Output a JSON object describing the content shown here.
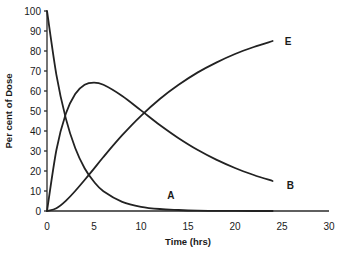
{
  "chart_data": {
    "type": "line",
    "title": "",
    "xlabel": "Time (hrs)",
    "ylabel": "Per cent of Dose",
    "xlim": [
      0,
      30
    ],
    "ylim": [
      0,
      100
    ],
    "x_ticks": [
      0,
      5,
      10,
      15,
      20,
      25,
      30
    ],
    "y_ticks": [
      0,
      10,
      20,
      30,
      40,
      50,
      60,
      70,
      80,
      90,
      100
    ],
    "grid": false,
    "legend": "inline labels at curve ends",
    "x": [
      0,
      1,
      2,
      3,
      4,
      5,
      6,
      8,
      10,
      12,
      14,
      16,
      18,
      20,
      22,
      24
    ],
    "series": [
      {
        "name": "A",
        "label_pos": [
          12.8,
          8
        ],
        "values": [
          100,
          68.1,
          46.3,
          31.5,
          21.4,
          14.6,
          9.9,
          4.6,
          2.1,
          1.0,
          0.5,
          0.2,
          0.1,
          0.05,
          0.02,
          0.0
        ]
      },
      {
        "name": "B",
        "label_pos": [
          25.5,
          13
        ],
        "values": [
          0,
          30.5,
          48.6,
          58.5,
          63.1,
          64.2,
          63.1,
          57.5,
          50.3,
          43.0,
          36.4,
          30.6,
          25.7,
          21.5,
          18.0,
          15.0
        ]
      },
      {
        "name": "E",
        "label_pos": [
          25.3,
          85
        ],
        "values": [
          0,
          1.4,
          5.1,
          10.0,
          15.5,
          21.2,
          27.0,
          37.9,
          47.6,
          56.0,
          63.1,
          69.2,
          74.2,
          78.5,
          82.0,
          85.0
        ]
      }
    ]
  },
  "layout": {
    "x0_px": 47,
    "y0_px": 211,
    "px_per_x": 9.4,
    "px_per_y": 2.0,
    "line_color": "#222222"
  }
}
